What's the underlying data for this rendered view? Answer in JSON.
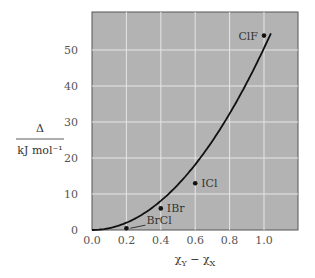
{
  "chart_data": {
    "type": "scatter",
    "title": "",
    "xlabel": "χ_Y − χ_X",
    "ylabel_top": "Δ",
    "ylabel_bottom": "kJ mol⁻¹",
    "xlim": [
      0,
      1.2
    ],
    "ylim": [
      0,
      60
    ],
    "xticks": [
      "0.0",
      "0.2",
      "0.4",
      "0.6",
      "0.8",
      "1.0"
    ],
    "yticks": [
      "0",
      "10",
      "20",
      "30",
      "40",
      "50"
    ],
    "grid": true,
    "points": [
      {
        "label": "BrCl",
        "x": 0.2,
        "y": 0.5
      },
      {
        "label": "IBr",
        "x": 0.4,
        "y": 6
      },
      {
        "label": "ICl",
        "x": 0.6,
        "y": 13
      },
      {
        "label": "ClF",
        "x": 1.0,
        "y": 54
      }
    ],
    "curve": {
      "description": "fitted curve Δ ∝ (χY − χX)^2",
      "x": [
        0,
        0.2,
        0.4,
        0.6,
        0.8,
        1.0,
        1.04
      ],
      "y": [
        0,
        1.3,
        7.8,
        19.5,
        35,
        52,
        55
      ]
    }
  },
  "colors": {
    "plot_bg": "#b3b3b3",
    "grid": "#e6e6e6",
    "curve": "#111111"
  }
}
